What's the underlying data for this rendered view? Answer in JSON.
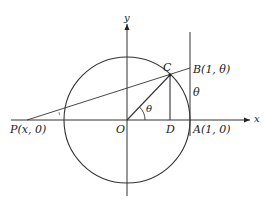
{
  "diagram": {
    "type": "unit-circle-geometry",
    "axes": {
      "x_label": "x",
      "y_label": "y"
    },
    "points": {
      "P": {
        "label": "P(x, 0)"
      },
      "O": {
        "label": "O"
      },
      "D": {
        "label": "D"
      },
      "A": {
        "label": "A(1, 0)"
      },
      "B": {
        "label": "B(1, θ)"
      },
      "C": {
        "label": "C"
      }
    },
    "angle_label": "θ",
    "segment_label": "θ",
    "colors": {
      "stroke": "#333333",
      "background": "#ffffff"
    }
  }
}
